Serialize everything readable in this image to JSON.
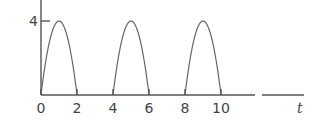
{
  "chart_data": {
    "type": "line",
    "title": "",
    "xlabel": "t",
    "ylabel": "",
    "xlim": [
      0,
      12
    ],
    "ylim": [
      0,
      4
    ],
    "x_ticks": [
      "0",
      "2",
      "4",
      "6",
      "8",
      "10"
    ],
    "y_ticks": [
      "4"
    ],
    "grid": false,
    "legend": "none",
    "series": [
      {
        "name": "pulse-1",
        "start": 0,
        "end": 2,
        "peak": 4,
        "shape": "parabolic arch"
      },
      {
        "name": "pulse-2",
        "start": 4,
        "end": 6,
        "peak": 4,
        "shape": "parabolic arch"
      },
      {
        "name": "pulse-3",
        "start": 8,
        "end": 10,
        "peak": 4,
        "shape": "parabolic arch"
      }
    ]
  }
}
